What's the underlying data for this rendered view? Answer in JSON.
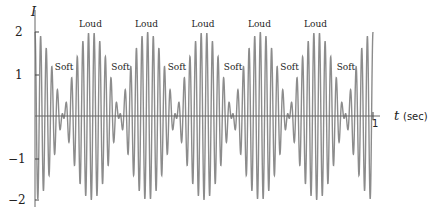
{
  "chart_data": {
    "type": "line",
    "title": "",
    "xlabel": "t (sec)",
    "ylabel": "I",
    "xlim": [
      0,
      1
    ],
    "ylim": [
      -2,
      2
    ],
    "x_ticks": [
      "1"
    ],
    "y_ticks": [
      "2",
      "1",
      "−1",
      "−2"
    ],
    "grid": false,
    "legend": null,
    "series": [
      {
        "name": "I(t) = cos(2π·57t) + cos(2π·63t)",
        "description": "Beats: carrier ~60 Hz, amplitude envelope 2|cos(2π·3t)| giving 6 loud/soft cycles per second",
        "color": "#8a8a8a"
      }
    ],
    "annotations": {
      "loud": [
        {
          "text": "Loud",
          "t": 0.167
        },
        {
          "text": "Loud",
          "t": 0.333
        },
        {
          "text": "Loud",
          "t": 0.5
        },
        {
          "text": "Loud",
          "t": 0.667
        },
        {
          "text": "Loud",
          "t": 0.833
        }
      ],
      "soft": [
        {
          "text": "Soft",
          "t": 0.083
        },
        {
          "text": "Soft",
          "t": 0.25
        },
        {
          "text": "Soft",
          "t": 0.417
        },
        {
          "text": "Soft",
          "t": 0.583
        },
        {
          "text": "Soft",
          "t": 0.75
        },
        {
          "text": "Soft",
          "t": 0.917
        }
      ]
    }
  },
  "labels": {
    "y_axis": "I",
    "x_axis_var": "t",
    "x_axis_unit": "(sec)",
    "tick_2": "2",
    "tick_1": "1",
    "tick_m1": "−1",
    "tick_m2": "−2",
    "tick_x1": "1",
    "loud": "Loud",
    "soft": "Soft"
  }
}
